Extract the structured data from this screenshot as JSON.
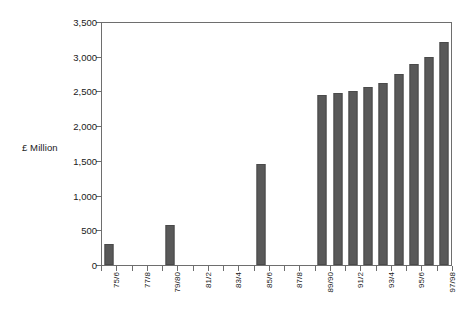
{
  "chart_data": {
    "type": "bar",
    "title": "",
    "subtitle": "",
    "xlabel": "",
    "ylabel": "£ Million",
    "ylim": [
      0,
      3500
    ],
    "ytick_labels": [
      "0",
      "500",
      "1,000",
      "1,500",
      "2,000",
      "2,500",
      "3,000",
      "3,500"
    ],
    "ytick_values": [
      0,
      500,
      1000,
      1500,
      2000,
      2500,
      3000,
      3500
    ],
    "grid": false,
    "legend": "none",
    "bar_color": "#595959",
    "axis_color": "#6e6e6e",
    "categories": [
      "75/6",
      "76/7",
      "77/8",
      "78/9",
      "79/80",
      "80/1",
      "81/2",
      "82/3",
      "83/4",
      "84/5",
      "85/6",
      "86/7",
      "87/8",
      "88/9",
      "89/90",
      "90/1",
      "91/2",
      "92/3",
      "93/4",
      "94/5",
      "95/6",
      "96/7",
      "97/98"
    ],
    "visible_tick_labels": [
      "75/6",
      "",
      "77/8",
      "",
      "79/80",
      "",
      "81/2",
      "",
      "83/4",
      "",
      "85/6",
      "",
      "87/8",
      "",
      "89/90",
      "",
      "91/2",
      "",
      "93/4",
      "",
      "95/6",
      "",
      "97/98"
    ],
    "values": [
      300,
      0,
      0,
      0,
      570,
      0,
      0,
      0,
      0,
      0,
      1460,
      0,
      0,
      0,
      2450,
      2480,
      2500,
      2560,
      2620,
      2750,
      2890,
      3000,
      3210
    ]
  },
  "y_axis": {
    "title": "£ Million"
  }
}
